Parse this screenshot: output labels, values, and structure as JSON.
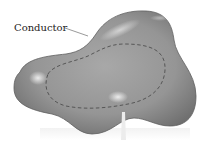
{
  "diagram": {
    "labels": [
      {
        "id": "conductor",
        "text": "Conductor"
      }
    ],
    "elements": {
      "conductor_body": {
        "shape": "irregular-blob",
        "fill": "#8e8e8e",
        "highlight": "#d4d4d4",
        "edge": "#5a5a5a"
      },
      "gaussian_surface": {
        "style": "dashed",
        "color": "#555555"
      },
      "leader_line_conductor": {
        "color": "#555555"
      },
      "leader_line_bottom": {
        "color": "#e6e6e6"
      }
    },
    "colors": {
      "background": "#ffffff",
      "body_mid": "#9a9a9a",
      "body_dark": "#6e6e6e",
      "highlight": "#e2e2e2"
    }
  }
}
